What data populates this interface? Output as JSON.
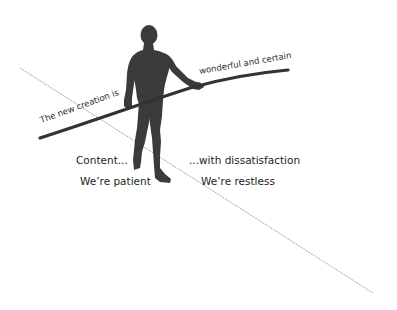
{
  "diagram": {
    "pole_text_left": "The new creation is",
    "pole_text_right": "wonderful and certain",
    "left_labels": {
      "line1": "Content...",
      "line2": "We’re patient"
    },
    "right_labels": {
      "line1": "...with dissatisfaction",
      "line2": "We’re restless"
    },
    "colors": {
      "silhouette": "#3a3a3a",
      "pole": "#333333",
      "rope": "#9a9a9a",
      "text": "#1e1e1e"
    }
  }
}
